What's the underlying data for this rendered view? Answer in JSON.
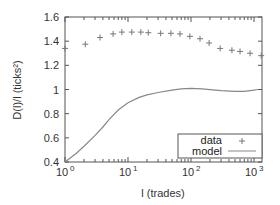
{
  "chart_data": {
    "type": "line",
    "title": "",
    "xlabel": "l (trades)",
    "ylabel": "D(l)/l (ticks²)",
    "xscale": "log",
    "xlim": [
      1,
      1150
    ],
    "ylim": [
      0.4,
      1.6
    ],
    "x_ticks": [
      {
        "value": 1,
        "label_base": "10",
        "label_exp": "0"
      },
      {
        "value": 10,
        "label_base": "10",
        "label_exp": "1"
      },
      {
        "value": 100,
        "label_base": "10",
        "label_exp": "2"
      },
      {
        "value": 1000,
        "label_base": "10",
        "label_exp": "3"
      }
    ],
    "y_ticks": [
      {
        "value": 0.4,
        "label": "0.4"
      },
      {
        "value": 0.6,
        "label": "0.6"
      },
      {
        "value": 0.8,
        "label": "0.8"
      },
      {
        "value": 1.0,
        "label": "1"
      },
      {
        "value": 1.2,
        "label": "1.2"
      },
      {
        "value": 1.4,
        "label": "1.4"
      },
      {
        "value": 1.6,
        "label": "1.6"
      }
    ],
    "grid": false,
    "legend_position": "lower right",
    "series": [
      {
        "name": "data",
        "style": "points",
        "marker": "+",
        "x": [
          1,
          2.1,
          3.6,
          5.8,
          8,
          11.5,
          16,
          21,
          33,
          48,
          67,
          96,
          139,
          194,
          290,
          446,
          600,
          866,
          1300
        ],
        "y": [
          1.34,
          1.375,
          1.43,
          1.46,
          1.475,
          1.475,
          1.475,
          1.47,
          1.465,
          1.465,
          1.46,
          1.44,
          1.42,
          1.385,
          1.34,
          1.325,
          1.315,
          1.3,
          1.28
        ]
      },
      {
        "name": "model",
        "style": "line",
        "x": [
          1,
          1.5,
          2,
          3,
          4,
          5,
          7,
          10,
          15,
          20,
          30,
          50,
          70,
          100,
          150,
          200,
          300,
          500,
          700,
          1000,
          1150
        ],
        "y": [
          0.4,
          0.47,
          0.53,
          0.62,
          0.69,
          0.75,
          0.83,
          0.89,
          0.935,
          0.955,
          0.975,
          0.995,
          1.005,
          1.01,
          1.005,
          0.998,
          0.99,
          0.985,
          0.985,
          0.995,
          1.0
        ]
      }
    ]
  },
  "legend": {
    "items": [
      {
        "label": "data",
        "symbol": "+"
      },
      {
        "label": "model",
        "symbol": "line"
      }
    ]
  },
  "colors": {
    "axis": "#555555",
    "data_marker": "#777777",
    "model_line": "#888888",
    "text": "#333333"
  }
}
